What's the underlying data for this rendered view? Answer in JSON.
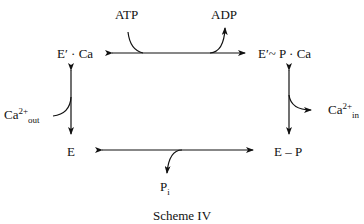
{
  "scheme": {
    "caption": "Scheme IV",
    "states": {
      "top_left": {
        "base": "E",
        "prime": "′",
        "rest": " · Ca"
      },
      "top_right": {
        "base": "E",
        "prime": "′",
        "rest": "~ P · Ca"
      },
      "bottom_left": {
        "base": "E"
      },
      "bottom_right": {
        "base": "E – P"
      }
    },
    "species": {
      "atp": "ATP",
      "adp": "ADP",
      "ca_out_base": "Ca",
      "ca_out_sup": "2+",
      "ca_out_sub": "out",
      "ca_in_base": "Ca",
      "ca_in_sup": "2+",
      "ca_in_sub": "in",
      "pi_base": "P",
      "pi_sub": "i"
    },
    "reactions": [
      {
        "from": "E′ · Ca",
        "to": "E′~ P · Ca",
        "reversible": true,
        "in": "ATP",
        "out": "ADP"
      },
      {
        "from": "E′~ P · Ca",
        "to": "E – P",
        "reversible": true,
        "out": "Ca2+ in"
      },
      {
        "from": "E – P",
        "to": "E",
        "reversible": true,
        "out": "Pi"
      },
      {
        "from": "E",
        "to": "E′ · Ca",
        "reversible": true,
        "in": "Ca2+ out"
      }
    ]
  }
}
